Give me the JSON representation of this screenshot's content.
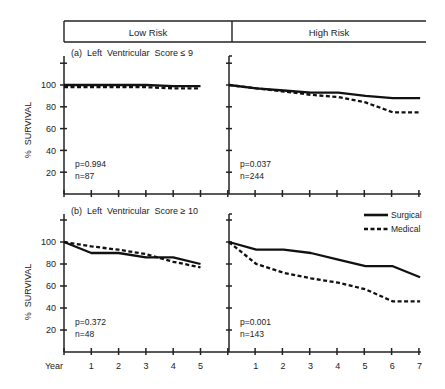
{
  "figure": {
    "column_headers": [
      "Low Risk",
      "High Risk"
    ],
    "row_titles": [
      "(a)  Left  Ventricular  Score ≤ 9",
      "(b)  Left  Ventricular  Score ≥ 10"
    ],
    "y_axis_label": "%  SURVIVAL",
    "x_axis_label": "Year",
    "legend": [
      {
        "name": "Surgical",
        "style": "solid"
      },
      {
        "name": "Medical",
        "style": "dashed"
      }
    ]
  },
  "chart_data": [
    {
      "type": "line",
      "title": "(a) Left Ventricular Score ≤ 9 — Low Risk",
      "xlabel": "Year",
      "ylabel": "% SURVIVAL",
      "x": [
        0,
        1,
        2,
        3,
        4,
        5
      ],
      "yticks": [
        20,
        40,
        60,
        80,
        100
      ],
      "ylim": [
        0,
        100
      ],
      "xlim": [
        0,
        6
      ],
      "series": [
        {
          "name": "Surgical",
          "values": [
            100,
            100,
            100,
            100,
            99,
            99
          ]
        },
        {
          "name": "Medical",
          "values": [
            98,
            98,
            98,
            98,
            97,
            97
          ]
        }
      ],
      "annotations": [
        "p=0.994",
        "n=87"
      ]
    },
    {
      "type": "line",
      "title": "(a) Left Ventricular Score ≤ 9 — High Risk",
      "xlabel": "Year",
      "ylabel": "% SURVIVAL",
      "x": [
        0,
        1,
        2,
        3,
        4,
        5,
        6,
        7
      ],
      "ylim": [
        0,
        100
      ],
      "xlim": [
        0,
        7
      ],
      "series": [
        {
          "name": "Surgical",
          "values": [
            100,
            97,
            95,
            93,
            93,
            90,
            88,
            88
          ]
        },
        {
          "name": "Medical",
          "values": [
            100,
            97,
            94,
            91,
            89,
            84,
            75,
            75
          ]
        }
      ],
      "annotations": [
        "p=0.037",
        "n=244"
      ]
    },
    {
      "type": "line",
      "title": "(b) Left Ventricular Score ≥ 10 — Low Risk",
      "xlabel": "Year",
      "ylabel": "% SURVIVAL",
      "x": [
        0,
        1,
        2,
        3,
        4,
        5
      ],
      "yticks": [
        20,
        40,
        60,
        80,
        100
      ],
      "ylim": [
        0,
        100
      ],
      "xlim": [
        0,
        6
      ],
      "series": [
        {
          "name": "Surgical",
          "values": [
            100,
            90,
            90,
            86,
            86,
            80
          ]
        },
        {
          "name": "Medical",
          "values": [
            100,
            96,
            93,
            89,
            82,
            77
          ]
        }
      ],
      "annotations": [
        "p=0.372",
        "n=48"
      ]
    },
    {
      "type": "line",
      "title": "(b) Left Ventricular Score ≥ 10 — High Risk",
      "xlabel": "Year",
      "ylabel": "% SURVIVAL",
      "x": [
        0,
        1,
        2,
        3,
        4,
        5,
        6,
        7
      ],
      "ylim": [
        0,
        100
      ],
      "xlim": [
        0,
        7
      ],
      "series": [
        {
          "name": "Surgical",
          "values": [
            100,
            93,
            93,
            90,
            84,
            78,
            78,
            68
          ]
        },
        {
          "name": "Medical",
          "values": [
            100,
            80,
            72,
            67,
            63,
            57,
            46,
            46
          ]
        }
      ],
      "annotations": [
        "p=0.001",
        "n=143"
      ]
    }
  ],
  "x_tick_labels": {
    "low_risk": [
      "1",
      "2",
      "3",
      "4",
      "5"
    ],
    "high_risk": [
      "1",
      "2",
      "3",
      "4",
      "5",
      "6",
      "7"
    ]
  },
  "y_tick_labels": [
    "100",
    "80",
    "60",
    "40",
    "20"
  ]
}
